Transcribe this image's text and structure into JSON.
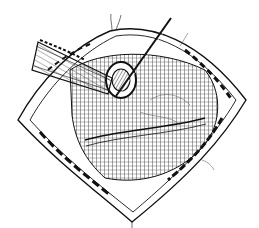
{
  "illustration": {
    "subject": "surgical field line drawing",
    "style": "black ink on white",
    "colors": {
      "ink": "#111111",
      "background": "#ffffff"
    },
    "elements": [
      "retracted-incision-edges",
      "tubular-drain",
      "puncture-site",
      "needle-instrument",
      "crosshatched-organ-tissue",
      "suture-threads"
    ]
  }
}
